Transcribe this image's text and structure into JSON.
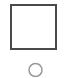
{
  "canvas": {
    "width": 66,
    "height": 78,
    "background_color": "#ffffff",
    "description": "Minimal line-drawing: an empty square outline above a small circle outline"
  },
  "shapes": [
    {
      "name": "square",
      "icon_name": "square-outline-icon",
      "label": "Square",
      "x": 11,
      "y": 5,
      "width": 45,
      "height": 44,
      "stroke_color": "#4a4a4a",
      "stroke_width": 2,
      "fill_color": "#ffffff"
    },
    {
      "name": "circle",
      "icon_name": "circle-outline-icon",
      "label": "Circle",
      "center_x": 35.5,
      "center_y": 70,
      "radius": 6.5,
      "stroke_color": "#9a9a9a",
      "stroke_width": 1.5,
      "fill_color": "none",
      "clipped_at_bottom": true
    }
  ]
}
